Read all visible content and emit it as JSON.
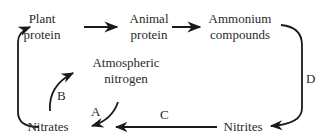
{
  "diagram": {
    "type": "nitrogen-cycle",
    "nodes": {
      "plant_protein": {
        "line1": "Plant",
        "line2": "protein"
      },
      "animal_protein": {
        "line1": "Animal",
        "line2": "protein"
      },
      "ammonium_compounds": {
        "line1": "Ammonium",
        "line2": "compounds"
      },
      "nitrites": {
        "label": "Nitrites"
      },
      "nitrates": {
        "label": "Nitrates"
      },
      "atmospheric_nitrogen": {
        "line1": "Atmospheric",
        "line2": "nitrogen"
      }
    },
    "edge_labels": {
      "A": "A",
      "B": "B",
      "C": "C",
      "D": "D"
    },
    "edges": [
      {
        "from": "Plant protein",
        "to": "Animal protein",
        "label": ""
      },
      {
        "from": "Animal protein",
        "to": "Ammonium compounds",
        "label": ""
      },
      {
        "from": "Ammonium compounds",
        "to": "Nitrites",
        "label": "D"
      },
      {
        "from": "Nitrites",
        "to": "Nitrates",
        "label": "C"
      },
      {
        "from": "Atmospheric nitrogen",
        "to": "Nitrates",
        "label": "A"
      },
      {
        "from": "Nitrates",
        "to": "Atmospheric nitrogen",
        "label": "B"
      },
      {
        "from": "Nitrates",
        "to": "Plant protein",
        "label": ""
      }
    ],
    "colors": {
      "ink": "#2a2a2a",
      "background": "#ffffff"
    }
  }
}
